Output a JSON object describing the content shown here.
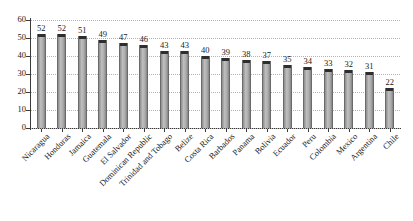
{
  "chart_data": {
    "type": "bar",
    "title": "",
    "subtitle": "",
    "xlabel": "",
    "ylabel": "",
    "ylim": [
      0,
      60
    ],
    "y_ticks": [
      0,
      10,
      20,
      30,
      40,
      50,
      60
    ],
    "grid": "horizontal-dotted",
    "legend": "none",
    "data_labels": true,
    "bar_color": "#aaaaaa",
    "bar_cap_color": "#2e2e2e",
    "bar_outline_color": "#6a6a6a",
    "grid_color": "#b4b4b4",
    "axis_color": "#3a3a3a",
    "text_color": "#1a1a1a",
    "categories": [
      "Nicaragua",
      "Honduras",
      "Jamaica",
      "Guatemala",
      "El Salvador",
      "Dominican Republic",
      "Trinidad and Tobago",
      "Belize",
      "Costa Rica",
      "Barbados",
      "Panama",
      "Bolivia",
      "Ecuador",
      "Peru",
      "Colombia",
      "Mexico",
      "Argentina",
      "Chile"
    ],
    "values": [
      52,
      52,
      51,
      49,
      47,
      46,
      43,
      43,
      40,
      39,
      38,
      37,
      35,
      34,
      33,
      32,
      31,
      22
    ]
  }
}
